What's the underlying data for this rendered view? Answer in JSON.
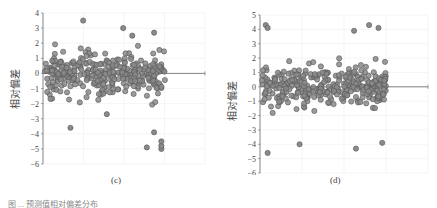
{
  "panels": [
    {
      "label": "(c)"
    },
    {
      "label": "(d)"
    }
  ],
  "caption": "图 ... 预测值相对偏差分布",
  "chart_data": [
    {
      "type": "scatter",
      "title": "(c)",
      "xlabel": "",
      "ylabel": "相对偏差",
      "ylim": [
        -6,
        4
      ],
      "yticks": [
        4,
        3,
        2,
        1,
        0,
        -1,
        -2,
        -3,
        -4,
        -5,
        -6
      ],
      "grid": true,
      "n_points_approx": 330,
      "x_range_samples": [
        0,
        330
      ],
      "notable_points": [
        {
          "x": 105,
          "y": 3.5
        },
        {
          "x": 215,
          "y": 3.0
        },
        {
          "x": 240,
          "y": 2.5
        },
        {
          "x": 300,
          "y": 2.7
        },
        {
          "x": 70,
          "y": -3.6
        },
        {
          "x": 170,
          "y": -2.7
        },
        {
          "x": 280,
          "y": -4.9
        },
        {
          "x": 300,
          "y": -3.9
        },
        {
          "x": 320,
          "y": -5.0
        },
        {
          "x": 320,
          "y": -4.8
        },
        {
          "x": 320,
          "y": -4.5
        }
      ]
    },
    {
      "type": "scatter",
      "title": "(d)",
      "xlabel": "",
      "ylabel": "相对偏差",
      "ylim": [
        -6,
        5
      ],
      "yticks": [
        5,
        4,
        3,
        2,
        1,
        0,
        -1,
        -2,
        -3,
        -4,
        -5,
        -6
      ],
      "grid": true,
      "n_points_approx": 330,
      "x_range_samples": [
        0,
        330
      ],
      "notable_points": [
        {
          "x": 10,
          "y": 4.3
        },
        {
          "x": 15,
          "y": 4.1
        },
        {
          "x": 245,
          "y": 3.9
        },
        {
          "x": 285,
          "y": 4.3
        },
        {
          "x": 310,
          "y": 4.1
        },
        {
          "x": 15,
          "y": -4.6
        },
        {
          "x": 100,
          "y": -4.0
        },
        {
          "x": 250,
          "y": -4.3
        },
        {
          "x": 320,
          "y": -3.9
        }
      ]
    }
  ]
}
